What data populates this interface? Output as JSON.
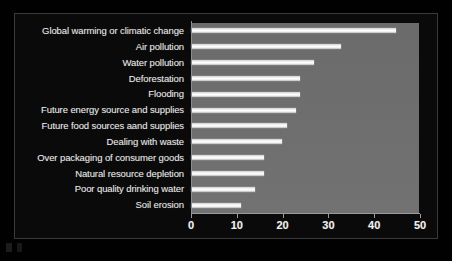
{
  "chart_data": {
    "type": "bar",
    "orientation": "horizontal",
    "title": "",
    "subtitle": "",
    "xlabel": "",
    "ylabel": "",
    "xlim": [
      0,
      50
    ],
    "xticks": [
      0,
      10,
      20,
      30,
      40,
      50
    ],
    "xticklabels": [
      "0",
      "10",
      "20",
      "30",
      "40",
      "50"
    ],
    "grid": false,
    "legend": null,
    "categories": [
      "Global warming or climatic change",
      "Air pollution",
      "Water pollution",
      "Deforestation",
      "Flooding",
      "Future energy source and supplies",
      "Future food sources aand supplies",
      "Dealing with waste",
      "Over packaging of consumer goods",
      "Natural resource depletion",
      "Poor quality drinking water",
      "Soil erosion"
    ],
    "values": [
      45,
      33,
      27,
      24,
      24,
      23,
      21,
      20,
      16,
      16,
      14,
      11
    ],
    "colors": {
      "bar": "#ffffff",
      "plot_background": "#6f6f6f",
      "figure_background": "#0a0a0a",
      "text": "#e9e9e9",
      "axis": "#9a9a9a"
    }
  }
}
